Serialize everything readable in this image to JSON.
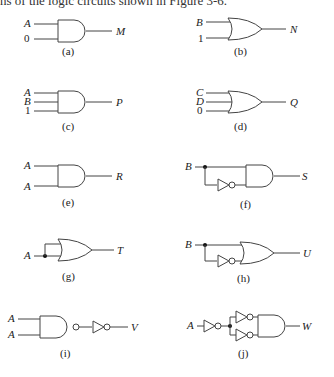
{
  "intro_text": "ns of the logic circuits shown in Figure 3-6.",
  "circuits": [
    {
      "id": "a",
      "caption": "(a)",
      "gate": "AND",
      "inputs": [
        "A",
        "0"
      ],
      "output": "M"
    },
    {
      "id": "b",
      "caption": "(b)",
      "gate": "OR",
      "inputs": [
        "B",
        "1"
      ],
      "output": "N"
    },
    {
      "id": "c",
      "caption": "(c)",
      "gate": "AND",
      "inputs": [
        "A",
        "B",
        "1"
      ],
      "output": "P"
    },
    {
      "id": "d",
      "caption": "(d)",
      "gate": "OR",
      "inputs": [
        "C",
        "D",
        "0"
      ],
      "output": "Q"
    },
    {
      "id": "e",
      "caption": "(e)",
      "gate": "AND",
      "inputs": [
        "A",
        "A"
      ],
      "output": "R"
    },
    {
      "id": "f",
      "caption": "(f)",
      "gate": "AND",
      "inputs": [
        "B"
      ],
      "extra": "B and NOT B",
      "output": "S"
    },
    {
      "id": "g",
      "caption": "(g)",
      "gate": "OR",
      "inputs": [
        "A"
      ],
      "extra": "A and A",
      "output": "T"
    },
    {
      "id": "h",
      "caption": "(h)",
      "gate": "OR",
      "inputs": [
        "B"
      ],
      "extra": "B and NOT B",
      "output": "U"
    },
    {
      "id": "i",
      "caption": "(i)",
      "gate": "NAND then NOT",
      "inputs": [
        "A",
        "A"
      ],
      "output": "V"
    },
    {
      "id": "j",
      "caption": "(j)",
      "gate": "NOT, two NOTs, AND",
      "inputs": [
        "A"
      ],
      "output": "W"
    }
  ]
}
